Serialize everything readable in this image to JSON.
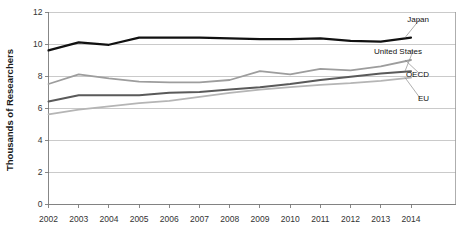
{
  "chart_data": {
    "type": "line",
    "title": "",
    "xlabel": "",
    "ylabel": "Thousands of Researchers",
    "x": [
      2002,
      2003,
      2004,
      2005,
      2006,
      2007,
      2008,
      2009,
      2010,
      2011,
      2012,
      2013,
      2014
    ],
    "categories": [
      "2002",
      "2003",
      "2004",
      "2005",
      "2006",
      "2007",
      "2008",
      "2009",
      "2010",
      "2011",
      "2012",
      "2013",
      "2014"
    ],
    "xlim": [
      2002,
      2014
    ],
    "ylim": [
      0,
      12
    ],
    "yticks": [
      0,
      2,
      4,
      6,
      8,
      10,
      12
    ],
    "ytick_labels": [
      "0",
      "2",
      "4",
      "6",
      "8",
      "10",
      "12"
    ],
    "grid": true,
    "legend_position": "right-inline-labels",
    "series": [
      {
        "name": "Japan",
        "color": "#111111",
        "width": 2.2,
        "values": [
          9.6,
          10.1,
          9.95,
          10.4,
          10.4,
          10.4,
          10.35,
          10.3,
          10.3,
          10.35,
          10.2,
          10.15,
          10.4
        ]
      },
      {
        "name": "OECD",
        "color": "#9d9d9d",
        "width": 1.8,
        "values": [
          7.5,
          8.1,
          7.85,
          7.65,
          7.6,
          7.6,
          7.75,
          8.3,
          8.1,
          8.45,
          8.35,
          8.6,
          9.0
        ]
      },
      {
        "name": "United States",
        "color": "#5a5a5a",
        "width": 2.0,
        "values": [
          6.4,
          6.8,
          6.8,
          6.8,
          6.95,
          7.0,
          7.15,
          7.3,
          7.5,
          7.75,
          7.95,
          8.15,
          8.3
        ]
      },
      {
        "name": "EU",
        "color": "#b5b5b5",
        "width": 1.8,
        "values": [
          5.6,
          5.9,
          6.1,
          6.3,
          6.45,
          6.7,
          6.95,
          7.15,
          7.3,
          7.45,
          7.55,
          7.7,
          7.9
        ]
      }
    ],
    "annotations": [
      {
        "label": "Japan",
        "x": 429,
        "y": 16
      },
      {
        "label": "United States",
        "x": 422,
        "y": 48
      },
      {
        "label": "OECD",
        "x": 429,
        "y": 71
      },
      {
        "label": "EU",
        "x": 429,
        "y": 95
      }
    ]
  }
}
